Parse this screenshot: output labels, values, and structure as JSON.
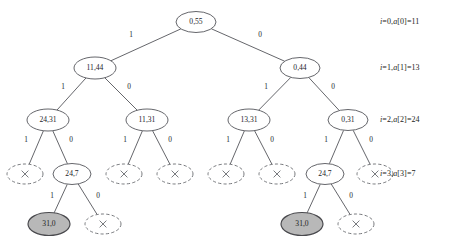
{
  "diagram": {
    "canvas": {
      "width": 471,
      "height": 249
    },
    "colors": {
      "stroke": "#53555a",
      "dashed_stroke": "#6a6c71",
      "node_fill": "#ffffff",
      "highlight_fill": "#b8b8b8",
      "text": "#24242a",
      "background": "#ffffff"
    },
    "levels": [
      {
        "index": 0,
        "label_plain": "i=0,a[0]=11",
        "label_parts": {
          "var": "i",
          "eq1": "=0,",
          "arr": "a",
          "eq2": "[0]=11"
        },
        "y": 22
      },
      {
        "index": 1,
        "label_plain": "i=1,a[1]=13",
        "label_parts": {
          "var": "i",
          "eq1": "=1,",
          "arr": "a",
          "eq2": "[1]=13"
        },
        "y": 68
      },
      {
        "index": 2,
        "label_plain": "i=2,a[2]=24",
        "label_parts": {
          "var": "i",
          "eq1": "=2,",
          "arr": "a",
          "eq2": "[2]=24"
        },
        "y": 120
      },
      {
        "index": 3,
        "label_plain": "i=3,a[3]=7",
        "label_parts": {
          "var": "i",
          "eq1": "=3,",
          "arr": "a",
          "eq2": "[3]=7"
        },
        "y": 174
      }
    ],
    "nodes": [
      {
        "id": "n0",
        "label": "0,55",
        "x": 196,
        "y": 22,
        "rx": 20,
        "ry": 10.5,
        "style": "solid",
        "level": 0
      },
      {
        "id": "n1",
        "label": "11,44",
        "x": 95,
        "y": 68,
        "rx": 21,
        "ry": 11,
        "style": "solid",
        "level": 1
      },
      {
        "id": "n2",
        "label": "0,44",
        "x": 300,
        "y": 68,
        "rx": 20,
        "ry": 10.5,
        "style": "solid",
        "level": 1
      },
      {
        "id": "n3",
        "label": "24,31",
        "x": 48,
        "y": 120,
        "rx": 21,
        "ry": 11,
        "style": "solid",
        "level": 2
      },
      {
        "id": "n4",
        "label": "11,31",
        "x": 147,
        "y": 120,
        "rx": 21,
        "ry": 11,
        "style": "solid",
        "level": 2
      },
      {
        "id": "n5",
        "label": "13,31",
        "x": 249,
        "y": 120,
        "rx": 21,
        "ry": 11,
        "style": "solid",
        "level": 2
      },
      {
        "id": "n6",
        "label": "0,31",
        "x": 348,
        "y": 120,
        "rx": 20,
        "ry": 10.5,
        "style": "solid",
        "level": 2
      },
      {
        "id": "n7",
        "label": "×",
        "x": 25,
        "y": 174,
        "rx": 18,
        "ry": 10,
        "style": "dashed",
        "level": 3
      },
      {
        "id": "n8",
        "label": "24,7",
        "x": 72,
        "y": 174,
        "rx": 19,
        "ry": 10.5,
        "style": "solid",
        "level": 3
      },
      {
        "id": "n9",
        "label": "×",
        "x": 124,
        "y": 174,
        "rx": 18,
        "ry": 10,
        "style": "dashed",
        "level": 3
      },
      {
        "id": "n10",
        "label": "×",
        "x": 175,
        "y": 174,
        "rx": 18,
        "ry": 10,
        "style": "dashed",
        "level": 3
      },
      {
        "id": "n11",
        "label": "×",
        "x": 226,
        "y": 174,
        "rx": 18,
        "ry": 10,
        "style": "dashed",
        "level": 3
      },
      {
        "id": "n12",
        "label": "×",
        "x": 277,
        "y": 174,
        "rx": 18,
        "ry": 10,
        "style": "dashed",
        "level": 3
      },
      {
        "id": "n13",
        "label": "24,7",
        "x": 325,
        "y": 174,
        "rx": 19,
        "ry": 10.5,
        "style": "solid",
        "level": 3
      },
      {
        "id": "n14",
        "label": "×",
        "x": 375,
        "y": 174,
        "rx": 18,
        "ry": 10,
        "style": "dashed",
        "level": 3
      },
      {
        "id": "n15",
        "label": "31,0",
        "x": 49,
        "y": 224,
        "rx": 21,
        "ry": 11.5,
        "style": "filled",
        "level": 4
      },
      {
        "id": "n16",
        "label": "×",
        "x": 103,
        "y": 224,
        "rx": 18,
        "ry": 10,
        "style": "dashed",
        "level": 4
      },
      {
        "id": "n17",
        "label": "31,0",
        "x": 302,
        "y": 224,
        "rx": 21,
        "ry": 11.5,
        "style": "filled",
        "level": 4
      },
      {
        "id": "n18",
        "label": "×",
        "x": 356,
        "y": 224,
        "rx": 18,
        "ry": 10,
        "style": "dashed",
        "level": 4
      }
    ],
    "edges": [
      {
        "from": "n0",
        "to": "n1",
        "label": "1",
        "lx": 131,
        "ly": 35
      },
      {
        "from": "n0",
        "to": "n2",
        "label": "0",
        "lx": 260,
        "ly": 35
      },
      {
        "from": "n1",
        "to": "n3",
        "label": "1",
        "lx": 63,
        "ly": 87
      },
      {
        "from": "n1",
        "to": "n4",
        "label": "0",
        "lx": 129,
        "ly": 87
      },
      {
        "from": "n2",
        "to": "n5",
        "label": "1",
        "lx": 266,
        "ly": 87
      },
      {
        "from": "n2",
        "to": "n6",
        "label": "0",
        "lx": 333,
        "ly": 87
      },
      {
        "from": "n3",
        "to": "n7",
        "label": "1",
        "lx": 26,
        "ly": 140
      },
      {
        "from": "n3",
        "to": "n8",
        "label": "0",
        "lx": 71,
        "ly": 140
      },
      {
        "from": "n4",
        "to": "n9",
        "label": "1",
        "lx": 125,
        "ly": 140
      },
      {
        "from": "n4",
        "to": "n10",
        "label": "0",
        "lx": 170,
        "ly": 140
      },
      {
        "from": "n5",
        "to": "n11",
        "label": "1",
        "lx": 228,
        "ly": 140
      },
      {
        "from": "n5",
        "to": "n12",
        "label": "0",
        "lx": 272,
        "ly": 140
      },
      {
        "from": "n6",
        "to": "n13",
        "label": "1",
        "lx": 326,
        "ly": 140
      },
      {
        "from": "n6",
        "to": "n14",
        "label": "0",
        "lx": 371,
        "ly": 140
      },
      {
        "from": "n8",
        "to": "n15",
        "label": "1",
        "lx": 52,
        "ly": 196
      },
      {
        "from": "n8",
        "to": "n16",
        "label": "0",
        "lx": 98,
        "ly": 196
      },
      {
        "from": "n13",
        "to": "n17",
        "label": "1",
        "lx": 305,
        "ly": 196
      },
      {
        "from": "n13",
        "to": "n18",
        "label": "0",
        "lx": 351,
        "ly": 196
      }
    ],
    "row_labels": [
      {
        "plain": "i=0,a[0]=11",
        "x": 380,
        "y": 17
      },
      {
        "plain": "i=1,a[1]=13",
        "x": 380,
        "y": 63
      },
      {
        "plain": "i=2,a[2]=24",
        "x": 380,
        "y": 115
      },
      {
        "plain": "i=3,a[3]=7",
        "x": 380,
        "y": 169
      }
    ]
  }
}
